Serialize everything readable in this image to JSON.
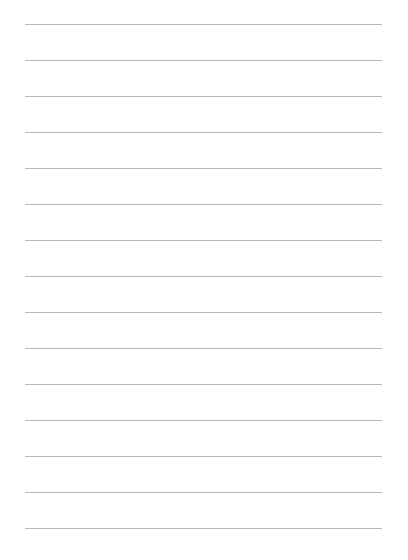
{
  "page": {
    "type": "lined-paper",
    "line_count": 15,
    "first_line_y": 24,
    "line_spacing": 36,
    "line_left": 25,
    "line_width": 357,
    "line_color": "#b8b8b8",
    "background": "#ffffff"
  }
}
